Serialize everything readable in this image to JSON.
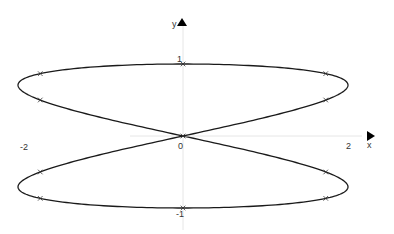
{
  "chart_data": {
    "type": "line",
    "title": "",
    "xlabel": "x",
    "ylabel": "y",
    "x_ticks": [
      "-2",
      "0",
      "2"
    ],
    "y_ticks": [
      "1",
      "-1"
    ],
    "xlim": [
      -2.2,
      2.2
    ],
    "ylim": [
      -1.3,
      1.6
    ],
    "grid": false,
    "legend": null,
    "series": [
      {
        "name": "curve",
        "param": "t",
        "x_expr": "2*sin(2*t)",
        "y_expr": "cos(t)",
        "marker_points": [
          {
            "x": 0,
            "y": 1
          },
          {
            "x": 1.73,
            "y": 0.866
          },
          {
            "x": 1.73,
            "y": 0.5
          },
          {
            "x": 0,
            "y": 0
          },
          {
            "x": -1.73,
            "y": -0.5
          },
          {
            "x": -1.73,
            "y": -0.866
          },
          {
            "x": 0,
            "y": -1
          },
          {
            "x": 1.73,
            "y": -0.866
          },
          {
            "x": 1.73,
            "y": -0.5
          },
          {
            "x": -1.73,
            "y": 0.5
          },
          {
            "x": -1.73,
            "y": 0.866
          }
        ]
      }
    ]
  },
  "labels": {
    "y_axis": "y",
    "x_axis": "x",
    "tick_one": "1",
    "tick_zero": "0",
    "tick_two": "2",
    "tick_neg_two": "-2",
    "tick_neg_one": "-1"
  },
  "colors": {
    "curve": "#1a1a1a",
    "axis": "#e6e6e6",
    "arrow": "#000000"
  }
}
